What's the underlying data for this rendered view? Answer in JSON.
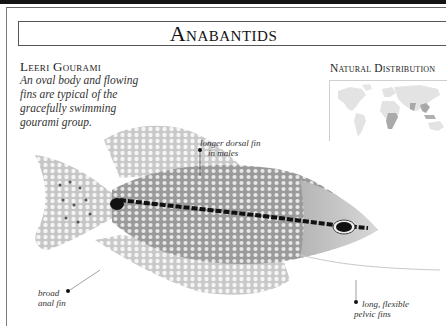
{
  "page": {
    "section_title": "Anabantids"
  },
  "species": {
    "name": "Leeri Gourami",
    "description": "An oval body and flowing fins are typical of the gracefully swimming gourami group."
  },
  "distribution_map": {
    "title": "Natural Distribution",
    "highlighted_regions": [
      "Africa",
      "South Asia",
      "Southeast Asia"
    ]
  },
  "annotations": [
    {
      "id": "dorsal",
      "text_line1": "longer dorsal fin",
      "text_line2": "in males"
    },
    {
      "id": "anal",
      "text_line1": "broad",
      "text_line2": "anal fin"
    },
    {
      "id": "pelvic",
      "text_line1": "long, flexible",
      "text_line2": "pelvic fins"
    }
  ],
  "colors": {
    "rule": "#141414",
    "text": "#1a1a1a",
    "map_land": "#e2e2e2",
    "map_highlight": "#a8a8a8"
  }
}
